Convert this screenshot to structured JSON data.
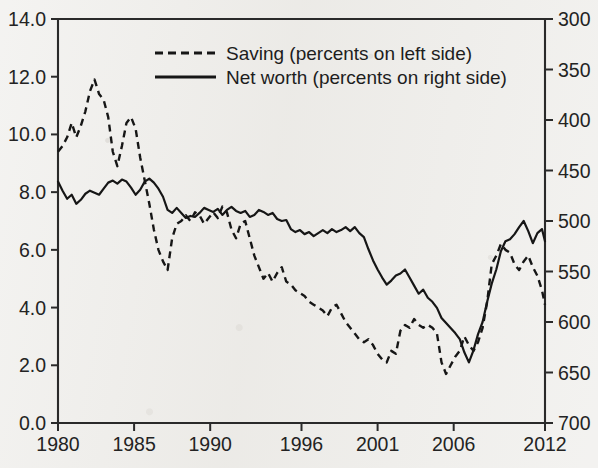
{
  "chart_data": {
    "type": "line",
    "title": "",
    "subtitle": "",
    "xlabel": "",
    "ylabel": "",
    "grid": false,
    "legend_position": "top-center",
    "xlim": [
      1980,
      2012
    ],
    "x_ticks": [
      "1980",
      "1985",
      "1990",
      "1996",
      "2001",
      "2006",
      "2012"
    ],
    "x_tick_values": [
      1980,
      1985,
      1990,
      1996,
      2001,
      2006,
      2012
    ],
    "left_axis": {
      "label": "Saving (percents on left side)",
      "ylim": [
        0.0,
        14.0
      ],
      "inverted": false,
      "ticks": [
        "0.0",
        "2.0",
        "4.0",
        "6.0",
        "8.0",
        "10.0",
        "12.0",
        "14.0"
      ],
      "tick_values": [
        0.0,
        2.0,
        4.0,
        6.0,
        8.0,
        10.0,
        12.0,
        14.0
      ]
    },
    "right_axis": {
      "label": "Net worth (percents on right side)",
      "ylim": [
        300,
        700
      ],
      "inverted": true,
      "ticks": [
        "300",
        "350",
        "400",
        "450",
        "500",
        "550",
        "600",
        "650",
        "700"
      ],
      "tick_values": [
        300,
        350,
        400,
        450,
        500,
        550,
        600,
        650,
        700
      ]
    },
    "series": [
      {
        "name": "Saving (percents on left side)",
        "axis": "left",
        "style": "dashed",
        "color": "#161616",
        "x": [
          1980.0,
          1980.3,
          1980.6,
          1980.9,
          1981.2,
          1981.5,
          1981.8,
          1982.1,
          1982.4,
          1982.7,
          1983.0,
          1983.3,
          1983.6,
          1983.9,
          1984.2,
          1984.5,
          1984.8,
          1985.1,
          1985.4,
          1985.7,
          1986.0,
          1986.3,
          1986.6,
          1986.9,
          1987.2,
          1987.5,
          1987.8,
          1988.1,
          1988.4,
          1988.7,
          1989.0,
          1989.3,
          1989.6,
          1989.9,
          1990.2,
          1990.5,
          1990.8,
          1991.1,
          1991.4,
          1991.7,
          1992.0,
          1992.3,
          1992.6,
          1992.9,
          1993.2,
          1993.5,
          1993.8,
          1994.1,
          1994.4,
          1994.7,
          1995.0,
          1995.3,
          1995.6,
          1995.9,
          1996.2,
          1996.5,
          1996.8,
          1997.1,
          1997.4,
          1997.7,
          1998.0,
          1998.3,
          1998.6,
          1998.9,
          1999.2,
          1999.5,
          1999.8,
          2000.1,
          2000.4,
          2000.7,
          2001.0,
          2001.3,
          2001.6,
          2001.9,
          2002.2,
          2002.5,
          2002.8,
          2003.1,
          2003.4,
          2003.7,
          2004.0,
          2004.3,
          2004.6,
          2004.9,
          2005.2,
          2005.5,
          2005.8,
          2006.1,
          2006.4,
          2006.7,
          2007.0,
          2007.3,
          2007.6,
          2007.9,
          2008.2,
          2008.5,
          2008.8,
          2009.1,
          2009.4,
          2009.7,
          2010.0,
          2010.3,
          2010.6,
          2010.9,
          2011.2,
          2011.5,
          2011.8,
          2012.0
        ],
        "y": [
          9.4,
          9.6,
          9.9,
          10.4,
          9.9,
          10.3,
          10.8,
          11.5,
          11.9,
          11.4,
          11.2,
          10.6,
          9.4,
          8.9,
          9.6,
          10.4,
          10.6,
          10.2,
          9.2,
          8.4,
          7.6,
          6.7,
          6.0,
          5.6,
          5.3,
          6.4,
          6.9,
          7.0,
          7.2,
          7.0,
          7.3,
          7.2,
          6.9,
          7.1,
          7.3,
          7.1,
          7.5,
          7.3,
          6.7,
          6.4,
          6.9,
          7.0,
          6.4,
          5.8,
          5.4,
          5.0,
          5.2,
          4.9,
          5.2,
          5.4,
          4.9,
          4.8,
          4.6,
          4.5,
          4.4,
          4.2,
          4.1,
          4.0,
          3.9,
          3.7,
          4.0,
          4.1,
          3.8,
          3.5,
          3.3,
          3.1,
          2.9,
          2.8,
          2.9,
          2.7,
          2.4,
          2.2,
          2.1,
          2.5,
          2.4,
          3.2,
          3.4,
          3.3,
          3.6,
          3.4,
          3.3,
          3.4,
          3.3,
          3.1,
          2.1,
          1.7,
          2.0,
          2.3,
          2.5,
          3.0,
          2.7,
          2.5,
          2.8,
          3.3,
          4.2,
          5.5,
          5.8,
          6.2,
          6.0,
          5.9,
          5.5,
          5.3,
          5.6,
          5.8,
          5.4,
          5.1,
          4.6,
          4.1
        ]
      },
      {
        "name": "Net worth (percents on right side)",
        "axis": "right",
        "style": "solid",
        "color": "#161616",
        "x": [
          1980.0,
          1980.3,
          1980.6,
          1980.9,
          1981.2,
          1981.5,
          1981.8,
          1982.1,
          1982.4,
          1982.7,
          1983.0,
          1983.3,
          1983.6,
          1983.9,
          1984.2,
          1984.5,
          1984.8,
          1985.1,
          1985.4,
          1985.7,
          1986.0,
          1986.3,
          1986.6,
          1986.9,
          1987.2,
          1987.5,
          1987.8,
          1988.1,
          1988.4,
          1988.7,
          1989.0,
          1989.3,
          1989.6,
          1989.9,
          1990.2,
          1990.5,
          1990.8,
          1991.1,
          1991.4,
          1991.7,
          1992.0,
          1992.3,
          1992.6,
          1992.9,
          1993.2,
          1993.5,
          1993.8,
          1994.1,
          1994.4,
          1994.7,
          1995.0,
          1995.3,
          1995.6,
          1995.9,
          1996.2,
          1996.5,
          1996.8,
          1997.1,
          1997.4,
          1997.7,
          1998.0,
          1998.3,
          1998.6,
          1998.9,
          1999.2,
          1999.5,
          1999.8,
          2000.1,
          2000.4,
          2000.7,
          2001.0,
          2001.3,
          2001.6,
          2001.9,
          2002.2,
          2002.5,
          2002.8,
          2003.1,
          2003.4,
          2003.7,
          2004.0,
          2004.3,
          2004.6,
          2004.9,
          2005.2,
          2005.5,
          2005.8,
          2006.1,
          2006.4,
          2006.7,
          2007.0,
          2007.3,
          2007.6,
          2007.9,
          2008.2,
          2008.5,
          2008.8,
          2009.1,
          2009.4,
          2009.7,
          2010.0,
          2010.3,
          2010.6,
          2010.9,
          2011.2,
          2011.5,
          2011.8,
          2012.0
        ],
        "y": [
          461,
          470,
          478,
          474,
          483,
          479,
          473,
          470,
          472,
          474,
          468,
          462,
          460,
          463,
          459,
          461,
          467,
          474,
          469,
          461,
          458,
          462,
          468,
          476,
          489,
          492,
          487,
          492,
          497,
          495,
          496,
          492,
          487,
          489,
          491,
          488,
          494,
          489,
          486,
          490,
          492,
          490,
          496,
          494,
          489,
          491,
          494,
          492,
          498,
          500,
          499,
          508,
          511,
          509,
          513,
          511,
          515,
          512,
          509,
          512,
          508,
          511,
          509,
          506,
          510,
          506,
          512,
          516,
          528,
          539,
          548,
          556,
          563,
          559,
          554,
          552,
          548,
          556,
          564,
          572,
          568,
          576,
          580,
          586,
          596,
          601,
          606,
          611,
          617,
          630,
          640,
          628,
          612,
          600,
          580,
          562,
          548,
          530,
          520,
          518,
          513,
          506,
          500,
          510,
          522,
          512,
          508,
          520
        ]
      }
    ]
  },
  "legend": {
    "items": [
      {
        "label": "Saving (percents on left side)",
        "style": "dashed"
      },
      {
        "label": "Net worth (percents on right side)",
        "style": "solid"
      }
    ]
  }
}
